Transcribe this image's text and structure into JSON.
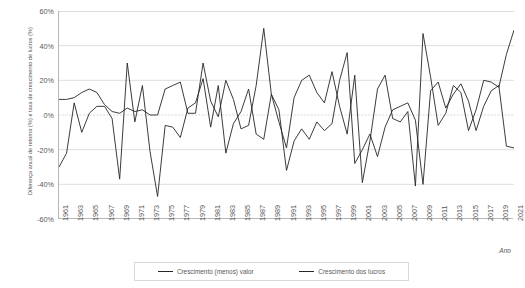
{
  "chart_data": {
    "type": "line",
    "title": "",
    "xlabel": "Ano",
    "ylabel": "Diferença anual de retorno (%) e taxa de crescimento de lucros (%)",
    "ylim": [
      -60,
      60
    ],
    "xlim": [
      1961,
      2021
    ],
    "ytick_values": [
      60,
      40,
      20,
      0,
      -20,
      -40,
      -60
    ],
    "ytick_labels": [
      "60%",
      "40%",
      "20%",
      "0%",
      "-20%",
      "-40%",
      "-60%"
    ],
    "xtick_labels": [
      "1961",
      "1963",
      "1965",
      "1967",
      "1969",
      "1971",
      "1973",
      "1975",
      "1977",
      "1979",
      "1981",
      "1983",
      "1985",
      "1987",
      "1989",
      "1991",
      "1993",
      "1995",
      "1997",
      "1999",
      "2001",
      "2003",
      "2005",
      "2007",
      "2009",
      "2011",
      "2013",
      "2015",
      "2017",
      "2019",
      "2021"
    ],
    "grid": "horizontal",
    "legend_position": "bottom",
    "x": [
      1961,
      1962,
      1963,
      1964,
      1965,
      1966,
      1967,
      1968,
      1969,
      1970,
      1971,
      1972,
      1973,
      1974,
      1975,
      1976,
      1977,
      1978,
      1979,
      1980,
      1981,
      1982,
      1983,
      1984,
      1985,
      1986,
      1987,
      1988,
      1989,
      1990,
      1991,
      1992,
      1993,
      1994,
      1995,
      1996,
      1997,
      1998,
      1999,
      2000,
      2001,
      2002,
      2003,
      2004,
      2005,
      2006,
      2007,
      2008,
      2009,
      2010,
      2011,
      2012,
      2013,
      2014,
      2015,
      2016,
      2017,
      2018,
      2019,
      2020,
      2021
    ],
    "series": [
      {
        "name": "Crescimento (menos) valor",
        "color": "#262626",
        "values": [
          -30,
          -22,
          7,
          -10,
          1,
          5,
          5,
          -2,
          -37,
          30,
          -4,
          17,
          -21,
          -47,
          -6,
          -7,
          -13,
          4,
          7,
          21,
          -7,
          17,
          -22,
          -5,
          2,
          15,
          -11,
          -14,
          12,
          3,
          -32,
          -15,
          -8,
          -14,
          -4,
          -9,
          -5,
          20,
          36,
          -28,
          -20,
          -11,
          -24,
          -7,
          3,
          5,
          7,
          -3,
          -40,
          14,
          19,
          4,
          12,
          18,
          8,
          -9,
          5,
          14,
          17,
          -18,
          -19
        ]
      },
      {
        "name": "Crescimento dos lucros",
        "color": "#262626",
        "values": [
          9,
          9,
          10,
          13,
          15,
          13,
          6,
          2,
          1,
          4,
          2,
          3,
          0,
          0,
          15,
          17,
          19,
          1,
          1,
          30,
          8,
          -1,
          20,
          9,
          -8,
          -6,
          17,
          50,
          12,
          -4,
          -19,
          10,
          20,
          23,
          13,
          7,
          25,
          5,
          -11,
          23,
          -39,
          -15,
          15,
          23,
          -2,
          -4,
          2,
          -41,
          47,
          22,
          -6,
          1,
          17,
          13,
          -9,
          3,
          20,
          19,
          16,
          35,
          49
        ]
      }
    ]
  },
  "legend": {
    "items": [
      {
        "label": "Crescimento (menos) valor"
      },
      {
        "label": "Crescimento dos lucros"
      }
    ]
  }
}
